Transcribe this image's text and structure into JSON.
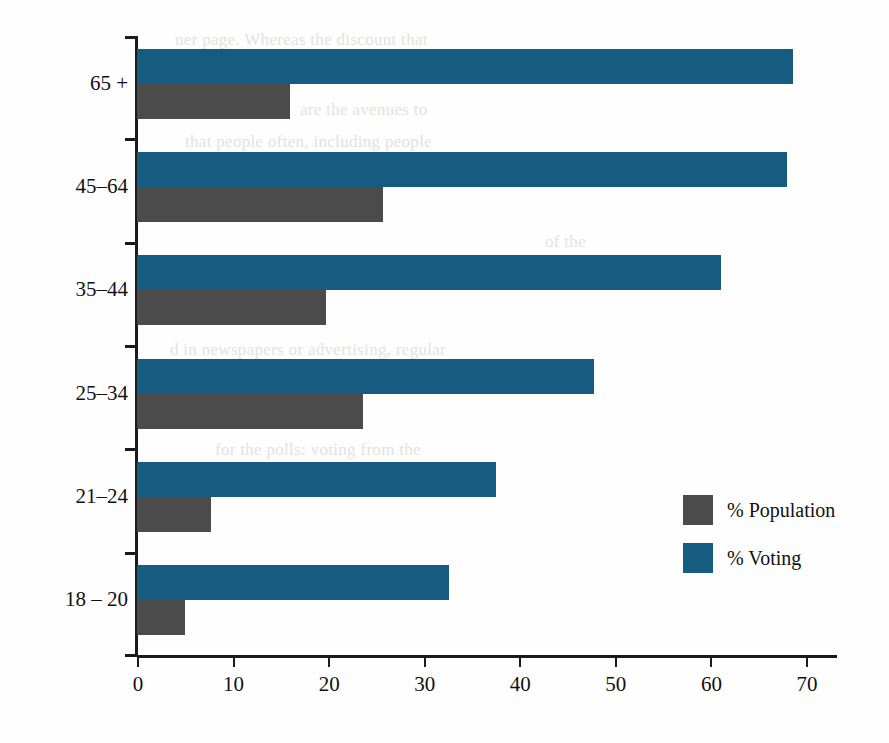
{
  "chart_data": {
    "type": "bar",
    "orientation": "horizontal",
    "title": "",
    "xlabel": "",
    "ylabel": "",
    "categories": [
      "65 +",
      "45–64",
      "35–44",
      "25–34",
      "21–24",
      "18 – 20"
    ],
    "series": [
      {
        "name": "% Population",
        "color": "#4b4b4b",
        "values": [
          16.0,
          25.7,
          19.8,
          23.6,
          7.7,
          5.0
        ]
      },
      {
        "name": "% Voting",
        "color": "#165b80",
        "values": [
          68.6,
          68.0,
          61.1,
          47.8,
          37.6,
          32.6
        ]
      }
    ],
    "xlim": [
      0,
      70
    ],
    "xticks": [
      0,
      10,
      20,
      30,
      40,
      50,
      60,
      70
    ],
    "xtick_labels": [
      "0",
      "10",
      "20",
      "30",
      "40",
      "50",
      "60",
      "70"
    ],
    "grid": false,
    "legend_position": "center-right",
    "legend_entries": [
      "% Population",
      "% Voting"
    ]
  },
  "legend": {
    "population_label": "% Population",
    "voting_label": "% Voting"
  },
  "background_text": {
    "line1": "ner page. Whereas the discount that",
    "line2": "are the avenues to",
    "line3": "that people often, including people",
    "line4": "of the",
    "line5": "d in newspapers or advertising, regular",
    "line6": "for the polls: voting from the"
  }
}
